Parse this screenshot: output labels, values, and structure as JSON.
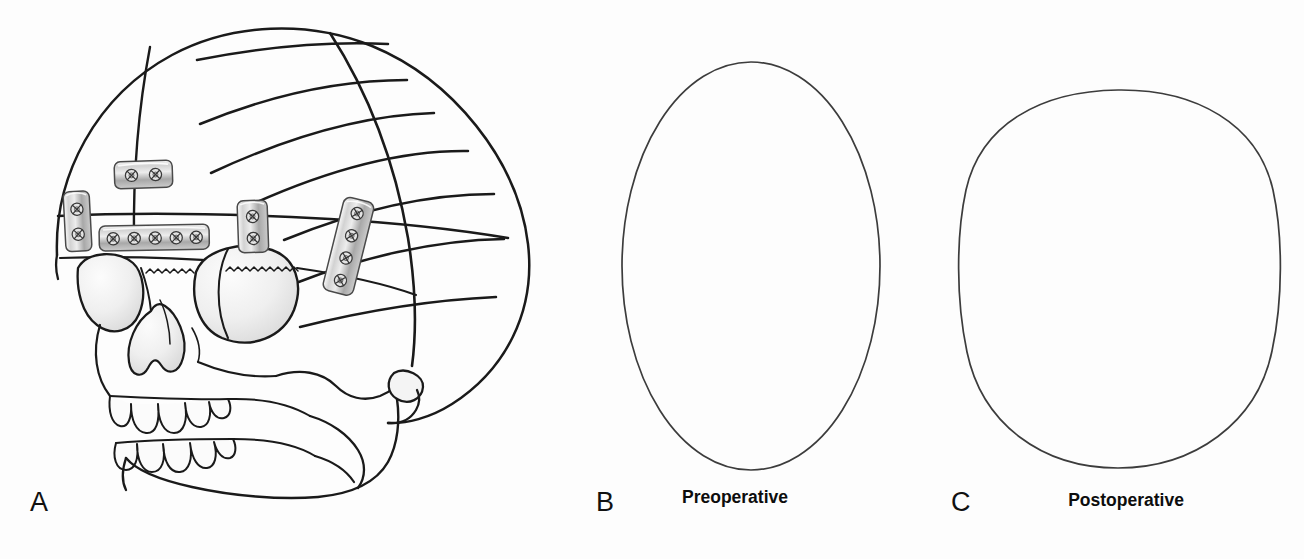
{
  "figure": {
    "width": 1304,
    "height": 559,
    "background_color": "#fdfdfd",
    "ink_color": "#1a1a1a",
    "hardware_color": "#b9b9b9",
    "shading_color": "#e8e8e8"
  },
  "panels": [
    {
      "id": "a",
      "letter": "A",
      "name": "skull-lateral-with-fixation-plates",
      "description": "Lateral view line drawing of a skull showing cranial vault osteotomy lines and titanium fixation plates with screws"
    },
    {
      "id": "b",
      "letter": "B",
      "caption": "Preoperative",
      "name": "preoperative-head-shape",
      "shape": "narrow-tall-oval"
    },
    {
      "id": "c",
      "letter": "C",
      "caption": "Postoperative",
      "name": "postoperative-head-shape",
      "shape": "wide-rounded-squircle"
    }
  ],
  "skull": {
    "osteotomy_line_count": 7,
    "suture_line_count": 2,
    "upper_teeth_count": 5,
    "lower_teeth_count": 5,
    "orbits": 2
  },
  "fixation_plates": [
    {
      "id": "plate-left-lateral",
      "name": "fixation-plate-left-lateral",
      "orientation": "vertical",
      "screw_count": 2,
      "x": 63,
      "y": 192,
      "w": 26,
      "h": 60,
      "rotation": -3
    },
    {
      "id": "plate-superior",
      "name": "fixation-plate-superior",
      "orientation": "horizontal",
      "screw_count": 2,
      "x": 114,
      "y": 162,
      "w": 58,
      "h": 27,
      "rotation": -2
    },
    {
      "id": "plate-supraorbital-bar",
      "name": "fixation-plate-supraorbital-bar",
      "orientation": "horizontal",
      "screw_count": 5,
      "x": 99,
      "y": 226,
      "w": 110,
      "h": 25,
      "rotation": -1
    },
    {
      "id": "plate-mid-temporal",
      "name": "fixation-plate-mid-temporal",
      "orientation": "vertical",
      "screw_count": 2,
      "x": 237,
      "y": 201,
      "w": 30,
      "h": 52,
      "rotation": -2
    },
    {
      "id": "plate-posterior-temporal",
      "name": "fixation-plate-posterior-temporal",
      "orientation": "oblique",
      "screw_count": 4,
      "x": 345,
      "y": 196,
      "w": 31,
      "h": 96,
      "rotation": 14
    }
  ],
  "preoperative_outline": {
    "cx": 751,
    "cy": 266,
    "rx": 129,
    "ry": 204
  },
  "postoperative_outline": {
    "cx": 1118,
    "cy": 279,
    "rx": 160,
    "ry": 190
  }
}
